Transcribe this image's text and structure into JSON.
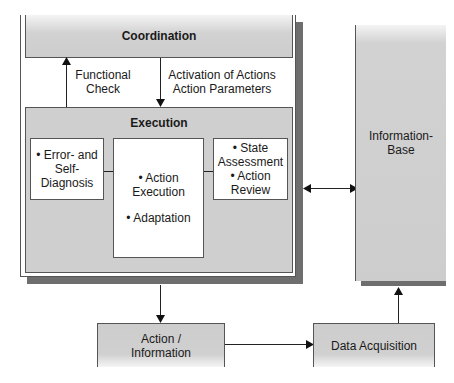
{
  "diagram": {
    "coordination": {
      "title": "Coordination"
    },
    "arrows": {
      "functional_check": [
        "Functional",
        "Check"
      ],
      "activation": [
        "Activation of Actions",
        "Action Parameters"
      ]
    },
    "execution": {
      "title": "Execution",
      "error_box": [
        "• Error- and",
        "Self-Diagnosis"
      ],
      "action_box": [
        "• Action",
        "Execution",
        "• Adaptation"
      ],
      "state_box": [
        "• State",
        "Assessment",
        "• Action",
        "Review"
      ]
    },
    "information_base": {
      "label": [
        "Information-",
        "Base"
      ]
    },
    "action_information": {
      "label": [
        "Action /",
        "Information"
      ]
    },
    "data_acquisition": {
      "label": "Data Acquisition"
    },
    "colors": {
      "box_fill": "#cfcfcf",
      "shadow": "#6e6e6e",
      "line": "#222222"
    }
  }
}
